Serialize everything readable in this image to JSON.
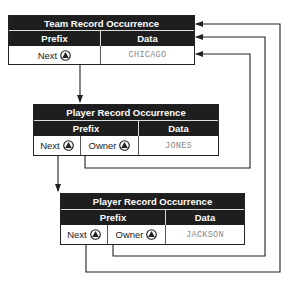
{
  "diagram": {
    "records": [
      {
        "title": "Team Record Occurrence",
        "prefix_label": "Prefix",
        "data_label": "Data",
        "pointers": [
          {
            "label": "Next",
            "icon": "pointer-triangle-icon"
          }
        ],
        "data_value": "CHICAGO"
      },
      {
        "title": "Player Record Occurrence",
        "prefix_label": "Prefix",
        "data_label": "Data",
        "pointers": [
          {
            "label": "Next",
            "icon": "pointer-triangle-icon"
          },
          {
            "label": "Owner",
            "icon": "pointer-triangle-icon"
          }
        ],
        "data_value": "JONES"
      },
      {
        "title": "Player Record Occurrence",
        "prefix_label": "Prefix",
        "data_label": "Data",
        "pointers": [
          {
            "label": "Next",
            "icon": "pointer-triangle-icon"
          },
          {
            "label": "Owner",
            "icon": "pointer-triangle-icon"
          }
        ],
        "data_value": "JACKSON"
      }
    ],
    "colors": {
      "header_bg": "#1e1e1e",
      "header_text": "#ffffff",
      "data_text": "#888888",
      "line": "#222222"
    }
  }
}
